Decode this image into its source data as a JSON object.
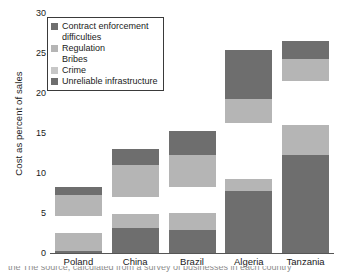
{
  "chart_data": {
    "type": "bar",
    "subtype": "stacked",
    "title": "",
    "xlabel": "",
    "ylabel": "Cost as percent of sales",
    "ylim": [
      0,
      30
    ],
    "yticks": [
      0,
      5,
      10,
      15,
      20,
      25,
      30
    ],
    "ytick_labels": [
      "0",
      "5",
      "10",
      "15",
      "20",
      "25",
      "30"
    ],
    "grid": false,
    "legend_position": "upper left",
    "categories": [
      "Poland",
      "China",
      "Brazil",
      "Algeria",
      "Tanzania"
    ],
    "series": [
      {
        "name": "Unreliable infrastructure",
        "color": "#6e6e6e",
        "values": [
          0.3,
          3.1,
          2.9,
          7.8,
          12.2
        ]
      },
      {
        "name": "Crime",
        "color": "#b5b5b5",
        "values": [
          2.2,
          1.8,
          2.1,
          1.5,
          3.8
        ]
      },
      {
        "name": "Bribes",
        "color": "#ffffff",
        "values": [
          2.1,
          2.1,
          3.3,
          6.9,
          5.5
        ]
      },
      {
        "name": "Regulation",
        "color": "#b5b5b5",
        "values": [
          2.7,
          4.0,
          3.9,
          3.1,
          2.8
        ]
      },
      {
        "name": "Contract enforcement difficulties",
        "color": "#6e6e6e",
        "values": [
          1.0,
          2.0,
          3.0,
          6.1,
          2.2
        ]
      }
    ]
  },
  "axis": {
    "y_title": "Cost as percent of sales",
    "ticks": [
      "30",
      "25",
      "20",
      "15",
      "10",
      "5",
      "0"
    ]
  },
  "legend": {
    "items": [
      {
        "label": "Contract enforcement",
        "label_cont": "difficulties",
        "swatch": "#6e6e6e",
        "has_swatch": true
      },
      {
        "label": "Regulation",
        "label_cont": "Bribes",
        "swatch": "#b5b5b5",
        "has_swatch": true
      },
      {
        "label": "Crime",
        "label_cont": "",
        "swatch": "#c7c7c7",
        "has_swatch": true
      },
      {
        "label": "Unreliable infrastructure",
        "label_cont": "",
        "swatch": "#6e6e6e",
        "has_swatch": true
      }
    ]
  },
  "x_labels": [
    "Poland",
    "China",
    "Brazil",
    "Algeria",
    "Tanzania"
  ],
  "caption": "the  The source, calculated from a survey of businesses in each country"
}
